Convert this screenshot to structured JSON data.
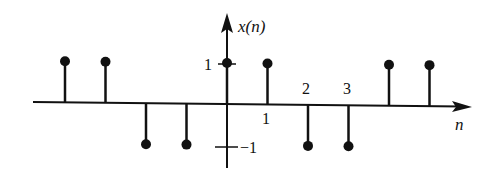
{
  "chart_data": {
    "type": "stem",
    "title": "",
    "xlabel": "n",
    "ylabel": "x(n)",
    "x": [
      -4,
      -3,
      -2,
      -1,
      0,
      1,
      2,
      3,
      4,
      5
    ],
    "values": [
      1,
      1,
      -1,
      -1,
      1,
      1,
      -1,
      -1,
      1,
      1
    ],
    "ylim": [
      -1,
      1
    ],
    "y_tick_labels": [
      "1",
      "−1"
    ],
    "x_tick_labels": [
      "1",
      "2",
      "3"
    ],
    "grid": false,
    "legend": null
  },
  "labels": {
    "y_axis": "x(n)",
    "x_axis": "n",
    "y_tick_pos": "1",
    "y_tick_neg": "−1",
    "x_tick_1": "1",
    "x_tick_2": "2",
    "x_tick_3": "3"
  },
  "colors": {
    "ink": "#111111",
    "background": "#ffffff"
  }
}
